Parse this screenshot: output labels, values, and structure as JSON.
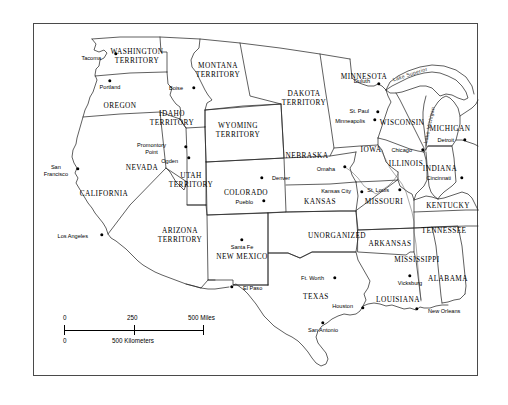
{
  "figure": {
    "kind": "historical-map",
    "region": "Western and Central United States",
    "era_note": "territorial period"
  },
  "frame": {
    "border_color": "#4a4a4a"
  },
  "states": [
    {
      "name": "WASHINGTON\nTERRITORY",
      "line1": "WASHINGTON",
      "line2": "TERRITORY",
      "x": 137,
      "y": 56,
      "type": "territory"
    },
    {
      "name": "OREGON",
      "line1": "OREGON",
      "line2": "",
      "x": 120,
      "y": 105,
      "type": "state"
    },
    {
      "name": "IDAHO\nTERRITORY",
      "line1": "IDAHO",
      "line2": "TERRITORY",
      "x": 172,
      "y": 118,
      "type": "territory"
    },
    {
      "name": "MONTANA\nTERRITORY",
      "line1": "MONTANA",
      "line2": "TERRITORY",
      "x": 218,
      "y": 70,
      "type": "territory"
    },
    {
      "name": "WYOMING\nTERRITORY",
      "line1": "WYOMING",
      "line2": "TERRITORY",
      "x": 238,
      "y": 130,
      "type": "territory"
    },
    {
      "name": "DAKOTA\nTERRITORY",
      "line1": "DAKOTA",
      "line2": "TERRITORY",
      "x": 304,
      "y": 98,
      "type": "territory"
    },
    {
      "name": "NEVADA",
      "line1": "NEVADA",
      "line2": "",
      "x": 142,
      "y": 167,
      "type": "state"
    },
    {
      "name": "CALIFORNIA",
      "line1": "CALIFORNIA",
      "line2": "",
      "x": 104,
      "y": 193,
      "type": "state"
    },
    {
      "name": "UTAH\nTERRITORY",
      "line1": "UTAH",
      "line2": "TERRITORY",
      "x": 191,
      "y": 180,
      "type": "territory"
    },
    {
      "name": "ARIZONA\nTERRITORY",
      "line1": "ARIZONA",
      "line2": "TERRITORY",
      "x": 180,
      "y": 235,
      "type": "territory"
    },
    {
      "name": "NEW MEXICO",
      "line1": "NEW MEXICO",
      "line2": "",
      "x": 242,
      "y": 256,
      "type": "state"
    },
    {
      "name": "COLORADO",
      "line1": "COLORADO",
      "line2": "",
      "x": 246,
      "y": 192,
      "type": "state"
    },
    {
      "name": "NEBRASKA",
      "line1": "NEBRASKA",
      "line2": "",
      "x": 307,
      "y": 155,
      "type": "state"
    },
    {
      "name": "KANSAS",
      "line1": "KANSAS",
      "line2": "",
      "x": 320,
      "y": 201,
      "type": "state"
    },
    {
      "name": "UNORGANIZED",
      "line1": "UNORGANIZED",
      "line2": "",
      "x": 337,
      "y": 235,
      "type": "unorganized"
    },
    {
      "name": "TEXAS",
      "line1": "TEXAS",
      "line2": "",
      "x": 316,
      "y": 296,
      "type": "state"
    },
    {
      "name": "MINNESOTA",
      "line1": "MINNESOTA",
      "line2": "",
      "x": 364,
      "y": 76,
      "type": "state"
    },
    {
      "name": "IOWA",
      "line1": "IOWA",
      "line2": "",
      "x": 371,
      "y": 149,
      "type": "state"
    },
    {
      "name": "WISCONSIN",
      "line1": "WISCONSIN",
      "line2": "",
      "x": 402,
      "y": 122,
      "type": "state"
    },
    {
      "name": "MICHIGAN",
      "line1": "MICHIGAN",
      "line2": "",
      "x": 450,
      "y": 128,
      "type": "state"
    },
    {
      "name": "ILLINOIS",
      "line1": "ILLINOIS",
      "line2": "",
      "x": 406,
      "y": 163,
      "type": "state"
    },
    {
      "name": "INDIANA",
      "line1": "INDIANA",
      "line2": "",
      "x": 440,
      "y": 168,
      "type": "state"
    },
    {
      "name": "MISSOURI",
      "line1": "MISSOURI",
      "line2": "",
      "x": 384,
      "y": 201,
      "type": "state"
    },
    {
      "name": "KENTUCKY",
      "line1": "KENTUCKY",
      "line2": "",
      "x": 448,
      "y": 205,
      "type": "state"
    },
    {
      "name": "TENNESSEE",
      "line1": "TENNESSEE",
      "line2": "",
      "x": 444,
      "y": 230,
      "type": "state"
    },
    {
      "name": "ARKANSAS",
      "line1": "ARKANSAS",
      "line2": "",
      "x": 390,
      "y": 243,
      "type": "state"
    },
    {
      "name": "MISSISSIPPI",
      "line1": "MISSISSIPPI",
      "line2": "",
      "x": 417,
      "y": 259,
      "type": "state"
    },
    {
      "name": "ALABAMA",
      "line1": "ALABAMA",
      "line2": "",
      "x": 448,
      "y": 278,
      "type": "state"
    },
    {
      "name": "LOUISIANA",
      "line1": "LOUISIANA",
      "line2": "",
      "x": 398,
      "y": 299,
      "type": "state"
    }
  ],
  "cities": [
    {
      "name": "Tacoma",
      "x": 116,
      "y": 54,
      "label_x": 101,
      "label_y": 58,
      "align": "right"
    },
    {
      "name": "Portland",
      "x": 110,
      "y": 81,
      "label_x": 110,
      "label_y": 87,
      "align": "center"
    },
    {
      "name": "Boise",
      "x": 194,
      "y": 88,
      "label_x": 183,
      "label_y": 88,
      "align": "right"
    },
    {
      "name": "Promontory Point",
      "x": 186,
      "y": 147,
      "label_x": 166,
      "label_y": 148,
      "align": "right",
      "two_line": true,
      "line1": "Promontory",
      "line2": "Point"
    },
    {
      "name": "Ogden",
      "x": 189,
      "y": 158,
      "label_x": 178,
      "label_y": 161,
      "align": "right"
    },
    {
      "name": "San Francisco",
      "x": 78,
      "y": 169,
      "label_x": 68,
      "label_y": 170,
      "align": "right",
      "two_line": true,
      "line1": "San",
      "line2": "Francisco"
    },
    {
      "name": "Los Angeles",
      "x": 102,
      "y": 235,
      "label_x": 88,
      "label_y": 236,
      "align": "right"
    },
    {
      "name": "Denver",
      "x": 262,
      "y": 178,
      "label_x": 272,
      "label_y": 178,
      "align": "left"
    },
    {
      "name": "Pueblo",
      "x": 264,
      "y": 201,
      "label_x": 253,
      "label_y": 202,
      "align": "right"
    },
    {
      "name": "Santa Fe",
      "x": 242,
      "y": 240,
      "label_x": 242,
      "label_y": 247,
      "align": "center"
    },
    {
      "name": "El Paso",
      "x": 232,
      "y": 287,
      "label_x": 243,
      "label_y": 288,
      "align": "left"
    },
    {
      "name": "Omaha",
      "x": 345,
      "y": 167,
      "label_x": 335,
      "label_y": 169,
      "align": "right"
    },
    {
      "name": "Kansas City",
      "x": 362,
      "y": 192,
      "label_x": 351,
      "label_y": 191,
      "align": "right"
    },
    {
      "name": "St. Louis",
      "x": 400,
      "y": 190,
      "label_x": 389,
      "label_y": 190,
      "align": "right"
    },
    {
      "name": "Duluth",
      "x": 379,
      "y": 84,
      "label_x": 370,
      "label_y": 81,
      "align": "right"
    },
    {
      "name": "St. Paul",
      "x": 378,
      "y": 112,
      "label_x": 369,
      "label_y": 111,
      "align": "right"
    },
    {
      "name": "Minneapolis",
      "x": 375,
      "y": 120,
      "label_x": 365,
      "label_y": 121,
      "align": "right"
    },
    {
      "name": "Chicago",
      "x": 423,
      "y": 150,
      "label_x": 412,
      "label_y": 150,
      "align": "right"
    },
    {
      "name": "Detroit",
      "x": 465,
      "y": 140,
      "label_x": 454,
      "label_y": 140,
      "align": "right"
    },
    {
      "name": "Cincinnati",
      "x": 462,
      "y": 178,
      "label_x": 451,
      "label_y": 178,
      "align": "right"
    },
    {
      "name": "Ft. Worth",
      "x": 335,
      "y": 278,
      "label_x": 324,
      "label_y": 278,
      "align": "right"
    },
    {
      "name": "Houston",
      "x": 363,
      "y": 308,
      "label_x": 353,
      "label_y": 306,
      "align": "right"
    },
    {
      "name": "San Antonio",
      "x": 323,
      "y": 323,
      "label_x": 323,
      "label_y": 330,
      "align": "center"
    },
    {
      "name": "Vicksburg",
      "x": 410,
      "y": 276,
      "label_x": 410,
      "label_y": 283,
      "align": "center"
    },
    {
      "name": "New Orleans",
      "x": 417,
      "y": 309,
      "label_x": 428,
      "label_y": 311,
      "align": "left"
    }
  ],
  "lakes": [
    {
      "name": "Lake Superior",
      "x": 410,
      "y": 74,
      "rotate": -18
    },
    {
      "name": "Lake Michigan",
      "x": 429,
      "y": 125,
      "rotate": -78
    }
  ],
  "scale_bar": {
    "miles": {
      "ticks": [
        "0",
        "250",
        "500 Miles"
      ],
      "unit": "Miles",
      "max": 500
    },
    "kilometers": {
      "ticks": [
        "0",
        "500 Kilometers"
      ],
      "unit": "Kilometers",
      "max": 500
    }
  }
}
